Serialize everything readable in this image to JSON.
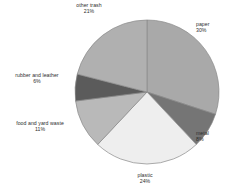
{
  "chart_data": {
    "type": "pie",
    "title": "",
    "subtitle": "",
    "xlabel": "",
    "ylabel": "",
    "legend_position": "none",
    "grid": false,
    "start_angle_deg": 0,
    "direction": "clockwise",
    "categories": [
      "paper",
      "metal",
      "plastic",
      "food and yard waste",
      "rubber and leather",
      "other trash"
    ],
    "values": [
      30,
      8,
      24,
      11,
      6,
      21
    ],
    "value_unit": "%",
    "colors": [
      "#a9a9a9",
      "#757575",
      "#eeeeee",
      "#b9b9b9",
      "#5b5b5b",
      "#b0b0b0"
    ],
    "slices": [
      {
        "label": "paper",
        "value": 30,
        "pct_text": "30%",
        "color": "#a9a9a9"
      },
      {
        "label": "metal",
        "value": 8,
        "pct_text": "8%",
        "color": "#757575"
      },
      {
        "label": "plastic",
        "value": 24,
        "pct_text": "24%",
        "color": "#eeeeee"
      },
      {
        "label": "food and yard waste",
        "value": 11,
        "pct_text": "11%",
        "color": "#b9b9b9"
      },
      {
        "label": "rubber and leather",
        "value": 6,
        "pct_text": "6%",
        "color": "#5b5b5b"
      },
      {
        "label": "other trash",
        "value": 21,
        "pct_text": "21%",
        "color": "#b0b0b0"
      }
    ]
  },
  "labels": {
    "paper": {
      "name": "paper",
      "pct": "30%"
    },
    "metal": {
      "name": "metal",
      "pct": "8%"
    },
    "plastic": {
      "name": "plastic",
      "pct": "24%"
    },
    "food": {
      "name": "food and yard waste",
      "pct": "11%"
    },
    "rubber": {
      "name": "rubber and leather",
      "pct": "6%"
    },
    "other_trash": {
      "name": "other trash",
      "pct": "21%"
    }
  },
  "style": {
    "background": "#ffffff",
    "outline": "#8a8a8a",
    "text_color": "#2e2e2e"
  }
}
